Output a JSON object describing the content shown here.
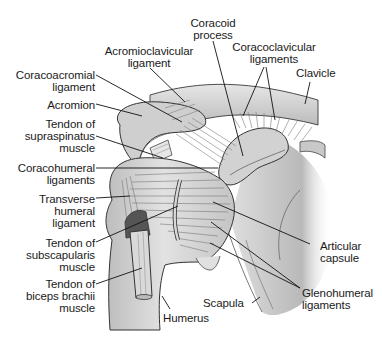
{
  "diagram": {
    "labels": {
      "coracoid_process": "Coracoid\nprocess",
      "acromioclavicular_ligament": "Acromioclavicular\nligament",
      "coracoclavicular_ligaments": "Coracoclavicular\nligaments",
      "clavicle": "Clavicle",
      "coracoacromial_ligament": "Coracoacromial\nligament",
      "acromion": "Acromion",
      "tendon_supraspinatus": "Tendon of\nsupraspinatus\nmuscle",
      "coracohumeral_ligaments": "Coracohumeral\nligaments",
      "transverse_humeral_ligament": "Transverse\nhumeral\nligament",
      "tendon_subscapularis": "Tendon of\nsubscapularis\nmuscle",
      "tendon_biceps": "Tendon of\nbiceps brachii\nmuscle",
      "humerus": "Humerus",
      "scapula": "Scapula",
      "articular_capsule": "Articular\ncapsule",
      "glenohumeral_ligaments": "Glenohumeral\nligaments"
    },
    "colors": {
      "bone_fill": "#d4d4d4",
      "bone_shadow": "#a9a9a9",
      "ligament_fill": "#ececec",
      "outline": "#3a3a3a",
      "leader": "#111111",
      "text": "#1a1a1a"
    }
  }
}
